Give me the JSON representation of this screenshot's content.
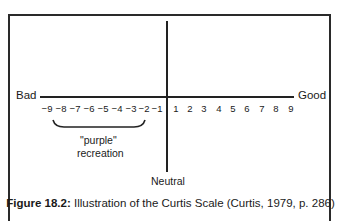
{
  "diagram": {
    "left_label": "Bad",
    "right_label": "Good",
    "bottom_label": "Neutral",
    "negative_ticks": [
      "−9",
      "−8",
      "−7",
      "−6",
      "−5",
      "−4",
      "−3",
      "−2",
      "−1"
    ],
    "positive_ticks": [
      "1",
      "2",
      "3",
      "4",
      "5",
      "6",
      "7",
      "8",
      "9"
    ],
    "brace_label_line1": "\"purple\"",
    "brace_label_line2": "recreation"
  },
  "caption": {
    "figure_label": "Figure 18.2:",
    "text": " Illustration of the Curtis Scale (Curtis, 1979, p. 286)"
  }
}
